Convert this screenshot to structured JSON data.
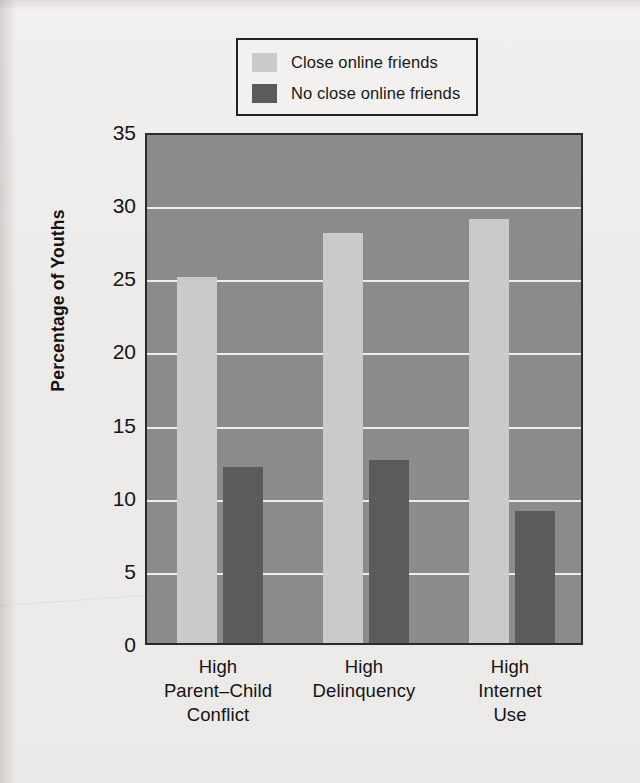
{
  "legend": {
    "items": [
      {
        "label": "Close online friends",
        "color": "#cacac8",
        "swatch_name": "legend-swatch-close-online-friends"
      },
      {
        "label": "No close online friends",
        "color": "#5b5b5b",
        "swatch_name": "legend-swatch-no-close-online-friends"
      }
    ]
  },
  "axis": {
    "ylabel": "Percentage of Youths",
    "yticks": [
      "0",
      "5",
      "10",
      "15",
      "20",
      "25",
      "30",
      "35"
    ]
  },
  "colors": {
    "plot_background": "#8b8b8b",
    "gridline": "#f4f3f1",
    "series_light": "#cacac8",
    "series_dark": "#5b5b5b",
    "page_background": "#eeecea",
    "frame": "#2a2a2a"
  },
  "chart_data": {
    "type": "bar",
    "title": "",
    "xlabel": "",
    "ylabel": "Percentage of Youths",
    "ylim": [
      0,
      35
    ],
    "ytick_step": 5,
    "grid": true,
    "legend_position": "top-center",
    "categories": [
      "High Parent–Child Conflict",
      "High Delinquency",
      "High Internet Use"
    ],
    "category_lines": [
      [
        "High",
        "Parent–Child",
        "Conflict"
      ],
      [
        "High",
        "Delinquency"
      ],
      [
        "High",
        "Internet",
        "Use"
      ]
    ],
    "series": [
      {
        "name": "Close online friends",
        "color": "#cacac8",
        "values": [
          25,
          28,
          29
        ]
      },
      {
        "name": "No close online friends",
        "color": "#5b5b5b",
        "values": [
          12,
          12.5,
          9
        ]
      }
    ]
  }
}
